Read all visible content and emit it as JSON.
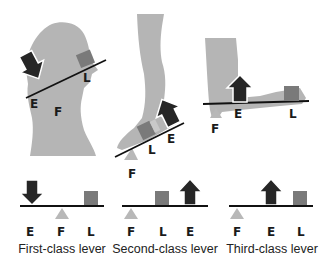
{
  "colors": {
    "silhouette": "#b5b5b5",
    "fulcrum": "#b8b8b8",
    "load": "#7a7a7a",
    "effort": "#262626",
    "lever_bar": "#111111",
    "text": "#1a1a1a"
  },
  "top_panels": [
    {
      "name": "head-neck",
      "labels": {
        "effort": "E",
        "fulcrum": "F",
        "load": "L"
      }
    },
    {
      "name": "foot-calf",
      "labels": {
        "effort": "E",
        "fulcrum": "F",
        "load": "L"
      }
    },
    {
      "name": "arm-elbow",
      "labels": {
        "effort": "E",
        "fulcrum": "F",
        "load": "L"
      }
    }
  ],
  "lever_classes": [
    {
      "caption": "First-class lever",
      "order": [
        "E",
        "F",
        "L"
      ]
    },
    {
      "caption": "Second-class lever",
      "order": [
        "F",
        "L",
        "E"
      ]
    },
    {
      "caption": "Third-class lever",
      "order": [
        "F",
        "E",
        "L"
      ]
    }
  ]
}
